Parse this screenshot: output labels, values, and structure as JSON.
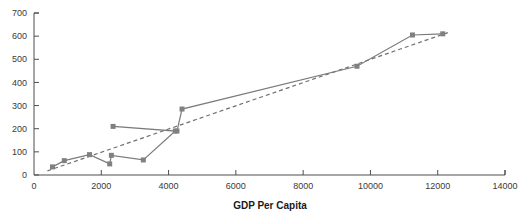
{
  "chart_data": {
    "type": "scatter",
    "title": "",
    "xlabel": "GDP Per Capita",
    "ylabel": "",
    "xlim": [
      0,
      14000
    ],
    "ylim": [
      0,
      700
    ],
    "grid": false,
    "legend": "none",
    "xticks": [
      0,
      2000,
      4000,
      6000,
      8000,
      10000,
      12000,
      14000
    ],
    "xtick_labels": [
      "0",
      "2000",
      "4000",
      "6000",
      "8000",
      "10000",
      "12000",
      "14000"
    ],
    "yticks": [
      0,
      100,
      200,
      300,
      400,
      500,
      600,
      700
    ],
    "ytick_labels": [
      "0",
      "100",
      "200",
      "300",
      "400",
      "500",
      "600",
      "700"
    ],
    "series": [
      {
        "name": "data",
        "style": "solid-line-with-square-markers",
        "color": "#808080",
        "x": [
          550,
          900,
          1650,
          2300,
          2250,
          2350,
          3250,
          4200,
          4250,
          4400,
          9600,
          11250,
          12150
        ],
        "y": [
          35,
          62,
          88,
          85,
          48,
          210,
          65,
          190,
          190,
          285,
          470,
          605,
          610
        ],
        "points": [
          {
            "x": 550,
            "y": 35
          },
          {
            "x": 900,
            "y": 62
          },
          {
            "x": 1650,
            "y": 88
          },
          {
            "x": 2300,
            "y": 85
          },
          {
            "x": 2250,
            "y": 48
          },
          {
            "x": 2350,
            "y": 210
          },
          {
            "x": 3250,
            "y": 65
          },
          {
            "x": 4200,
            "y": 190
          },
          {
            "x": 4250,
            "y": 190
          },
          {
            "x": 4400,
            "y": 285
          },
          {
            "x": 9600,
            "y": 470
          },
          {
            "x": 11250,
            "y": 605
          },
          {
            "x": 12150,
            "y": 610
          }
        ],
        "path_order": [
          {
            "x": 550,
            "y": 35
          },
          {
            "x": 900,
            "y": 62
          },
          {
            "x": 1650,
            "y": 88
          },
          {
            "x": 2250,
            "y": 48
          },
          {
            "x": 2300,
            "y": 85
          },
          {
            "x": 3250,
            "y": 65
          },
          {
            "x": 4200,
            "y": 190
          },
          {
            "x": 2350,
            "y": 210
          },
          {
            "x": 4250,
            "y": 190
          },
          {
            "x": 4400,
            "y": 285
          },
          {
            "x": 9600,
            "y": 470
          },
          {
            "x": 11250,
            "y": 605
          },
          {
            "x": 12150,
            "y": 610
          }
        ]
      },
      {
        "name": "trendline",
        "style": "dashed",
        "color": "#6f6f6f",
        "x": [
          400,
          12300
        ],
        "y": [
          18,
          615
        ]
      }
    ]
  }
}
